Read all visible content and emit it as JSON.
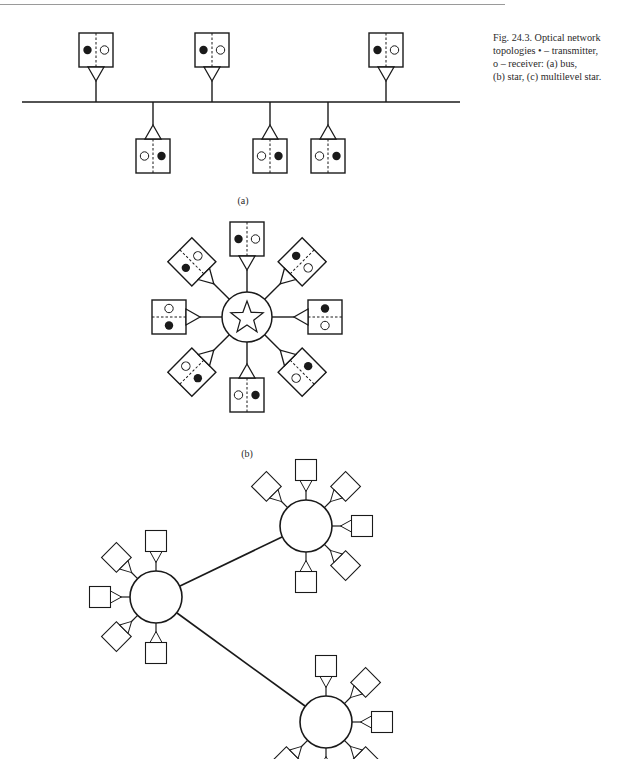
{
  "figure": {
    "caption_lines": [
      "Fig. 24.3.  Optical network",
      "topologies • – transmitter,",
      "o – receiver: (a) bus,",
      "(b) star, (c) multilevel star."
    ],
    "legend": {
      "transmitter_symbol": "filled-dot",
      "transmitter_label": "transmitter",
      "receiver_symbol": "open-circle",
      "receiver_label": "receiver"
    },
    "colors": {
      "line": "#1a1a1a",
      "background": "#ffffff",
      "text": "#2a2a2a"
    }
  },
  "panels": [
    {
      "id": "a",
      "label": "(a)",
      "topology": "bus",
      "nodes_above": 3,
      "nodes_below": 3
    },
    {
      "id": "b",
      "label": "(b)",
      "topology": "star",
      "hub_icon": "star-icon",
      "nodes": 8
    },
    {
      "id": "c",
      "label": "",
      "topology": "multilevel star",
      "hubs": 3,
      "nodes_per_hub": [
        5,
        6,
        6
      ]
    }
  ]
}
